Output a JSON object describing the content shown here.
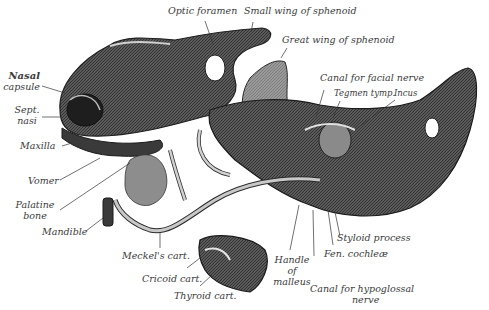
{
  "figure": {
    "colors": {
      "ink": "#2b2b2b",
      "shade_dark": "#3f3f3f",
      "shade_mid": "#6e6e6e",
      "shade_light": "#a9a9a9",
      "paper": "#ffffff",
      "label": "#3a3a3a"
    }
  },
  "labels": {
    "optic_foramen": "Optic foramen",
    "small_wing": "Small wing of sphenoid",
    "great_wing": "Great wing of sphenoid",
    "canal_facial": "Canal for facial nerve",
    "tegmen": "Tegmen tymp.",
    "incus": "Incus",
    "nasal_1": "Nasal",
    "nasal_2": "capsule",
    "sept_1": "Sept.",
    "sept_2": "nasi",
    "maxilla": "Maxilla",
    "vomer": "Vomer",
    "palatine_1": "Palatine",
    "palatine_2": "bone",
    "mandible": "Mandible",
    "meckel": "Meckel's cart.",
    "cricoid": "Cricoid cart.",
    "thyroid": "Thyroid cart.",
    "handle_1": "Handle",
    "handle_2": "of",
    "handle_3": "malleus",
    "fen": "Fen. cochleæ",
    "styloid": "Styloid process",
    "hypo_1": "Canal for hypoglossal",
    "hypo_2": "nerve"
  }
}
